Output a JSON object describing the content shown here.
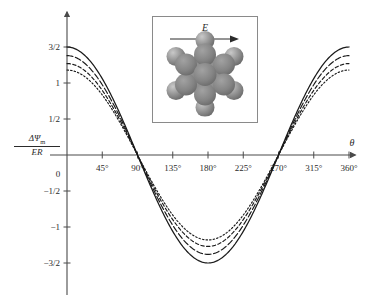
{
  "figure": {
    "background": "#ffffff",
    "axis_color": "#4a4a4a",
    "curve_color": "#1a1a1a"
  },
  "axes": {
    "y_axis_label": {
      "numerator": "ΔΨ",
      "numerator_sub": "m",
      "denominator": "ER"
    },
    "x_axis_label": "θ",
    "origin_label": "0",
    "x_ticks": [
      "45°",
      "90°",
      "135°",
      "180°",
      "225°",
      "270°",
      "315°",
      "360°"
    ],
    "x_tick_values": [
      45,
      90,
      135,
      180,
      225,
      270,
      315,
      360
    ],
    "y_ticks": [
      "3/2",
      "1",
      "1/2",
      "−1/2",
      "−1",
      "−3/2"
    ],
    "y_tick_values": [
      1.5,
      1.0,
      0.5,
      -0.5,
      -1.0,
      -1.5
    ]
  },
  "inset": {
    "field_label": "E",
    "field_arrow": "arrow-right",
    "molecule": {
      "name": "benzene-space-filling-model",
      "ring_atoms": 6,
      "outer_atoms": 6,
      "ring_color": "#8c8c8c",
      "atom_color": "#9a9a9a"
    }
  },
  "chart_data": {
    "type": "line",
    "title": "",
    "xlabel": "θ",
    "ylabel": "ΔΨm/ER",
    "xlim": [
      0,
      368
    ],
    "ylim": [
      -1.72,
      1.72
    ],
    "grid": false,
    "legend": "none",
    "x": [
      0,
      15,
      30,
      45,
      60,
      75,
      90,
      105,
      120,
      135,
      150,
      165,
      180,
      195,
      210,
      225,
      240,
      255,
      270,
      285,
      300,
      315,
      330,
      345,
      360
    ],
    "series": [
      {
        "name": "curve-1",
        "style": "solid",
        "amplitude": 1.5,
        "values": [
          1.5,
          1.449,
          1.299,
          1.061,
          0.75,
          0.388,
          0.0,
          -0.388,
          -0.75,
          -1.061,
          -1.299,
          -1.449,
          -1.5,
          -1.449,
          -1.299,
          -1.061,
          -0.75,
          -0.388,
          0.0,
          0.388,
          0.75,
          1.061,
          1.299,
          1.449,
          1.5
        ]
      },
      {
        "name": "curve-2",
        "style": "dashed",
        "amplitude": 1.38,
        "values": [
          1.38,
          1.333,
          1.195,
          0.976,
          0.69,
          0.357,
          0.0,
          -0.357,
          -0.69,
          -0.976,
          -1.195,
          -1.333,
          -1.38,
          -1.333,
          -1.195,
          -0.976,
          -0.69,
          -0.357,
          0.0,
          0.357,
          0.69,
          0.976,
          1.195,
          1.333,
          1.38
        ]
      },
      {
        "name": "curve-3",
        "style": "dashed-fine",
        "amplitude": 1.27,
        "values": [
          1.27,
          1.227,
          1.1,
          0.898,
          0.635,
          0.329,
          0.0,
          -0.329,
          -0.635,
          -0.898,
          -1.1,
          -1.227,
          -1.27,
          -1.227,
          -1.1,
          -0.898,
          -0.635,
          -0.329,
          0.0,
          0.329,
          0.635,
          0.898,
          1.1,
          1.227,
          1.27
        ]
      },
      {
        "name": "curve-4",
        "style": "dotted",
        "amplitude": 1.18,
        "values": [
          1.18,
          1.14,
          1.022,
          0.834,
          0.59,
          0.305,
          0.0,
          -0.305,
          -0.59,
          -0.834,
          -1.022,
          -1.14,
          -1.18,
          -1.14,
          -1.022,
          -0.834,
          -0.59,
          -0.305,
          0.0,
          0.305,
          0.59,
          0.834,
          1.022,
          1.14,
          1.18
        ]
      }
    ]
  }
}
